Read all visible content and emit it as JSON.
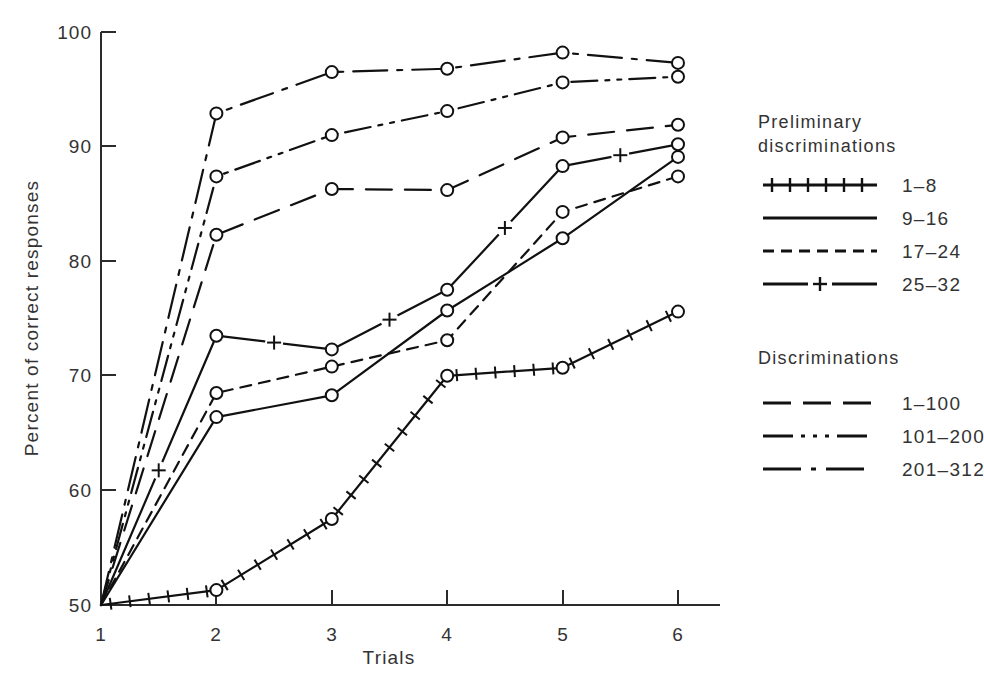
{
  "chart_data": {
    "type": "line",
    "title": "",
    "xlabel": "Trials",
    "ylabel": "Percent of correct responses",
    "x": [
      1,
      2,
      3,
      4,
      5,
      6
    ],
    "xticklabels": [
      "1",
      "2",
      "3",
      "4",
      "5",
      "6"
    ],
    "yticklabels": [
      "50",
      "60",
      "70",
      "80",
      "90",
      "100"
    ],
    "xlim": [
      1,
      6
    ],
    "ylim": [
      50,
      100
    ],
    "grid": false,
    "legend_position": "right",
    "series": [
      {
        "name": "1-8",
        "group": "Preliminary discriminations",
        "style": "solid-with-plus-ticks",
        "marker": "circle",
        "values": [
          50.0,
          51.3,
          57.5,
          70.0,
          70.7,
          75.6
        ]
      },
      {
        "name": "9-16",
        "group": "Preliminary discriminations",
        "style": "solid",
        "marker": "circle",
        "values": [
          50.0,
          66.4,
          68.3,
          75.7,
          82.0,
          89.1
        ]
      },
      {
        "name": "17-24",
        "group": "Preliminary discriminations",
        "style": "dashed",
        "marker": "circle",
        "values": [
          50.0,
          68.5,
          70.8,
          73.1,
          84.3,
          87.4
        ]
      },
      {
        "name": "25-32",
        "group": "Preliminary discriminations",
        "style": "solid-plus-midpoint",
        "marker": "plus",
        "values": [
          50.0,
          73.5,
          72.3,
          77.5,
          88.3,
          90.2
        ]
      },
      {
        "name": "1-100",
        "group": "Discriminations",
        "style": "long-dash",
        "marker": "circle",
        "values": [
          50.0,
          82.3,
          86.3,
          86.2,
          90.8,
          91.9
        ]
      },
      {
        "name": "101-200",
        "group": "Discriminations",
        "style": "dash-dot-dot",
        "marker": "circle",
        "values": [
          50.0,
          87.4,
          91.0,
          93.1,
          95.6,
          96.1
        ]
      },
      {
        "name": "201-312",
        "group": "Discriminations",
        "style": "dash-dot",
        "marker": "circle",
        "values": [
          50.0,
          92.9,
          96.5,
          96.8,
          98.2,
          97.3
        ]
      }
    ]
  },
  "axes": {
    "y_label": "Percent of correct responses",
    "x_label": "Trials",
    "y_ticks": [
      "100",
      "90",
      "80",
      "70",
      "60",
      "50"
    ],
    "x_ticks": [
      "1",
      "2",
      "3",
      "4",
      "5",
      "6"
    ]
  },
  "legend": {
    "groups": [
      {
        "heading_line1": "Preliminary",
        "heading_line2": "discriminations",
        "entries": [
          {
            "label": "1–8",
            "style": "solid-with-plus-ticks"
          },
          {
            "label": "9–16",
            "style": "solid"
          },
          {
            "label": "17–24",
            "style": "dashed"
          },
          {
            "label": "25–32",
            "style": "solid-plus-midpoint"
          }
        ]
      },
      {
        "heading_line1": "Discriminations",
        "heading_line2": "",
        "entries": [
          {
            "label": "1–100",
            "style": "long-dash"
          },
          {
            "label": "101–200",
            "style": "dash-dot-dot"
          },
          {
            "label": "201–312",
            "style": "dash-dot"
          }
        ]
      }
    ]
  },
  "colors": {
    "ink": "#111111",
    "axis": "#2b2b2b",
    "text": "#333333",
    "background": "#ffffff"
  }
}
